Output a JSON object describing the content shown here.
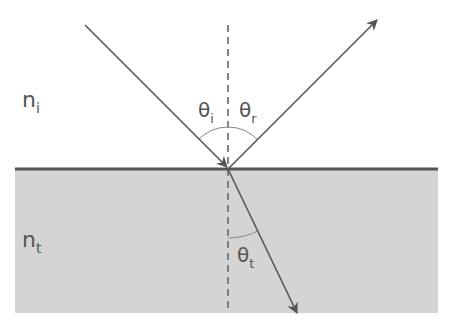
{
  "diagram": {
    "colors": {
      "background": "#ffffff",
      "medium_t": "#d4d4d4",
      "interface_line": "#555555",
      "ray": "#555555",
      "normal": "#666666",
      "arc": "#777777",
      "label": "#555555"
    },
    "regions": [
      {
        "id": "medium-i",
        "label": "n",
        "subscript": "i"
      },
      {
        "id": "medium-t",
        "label": "n",
        "subscript": "t"
      }
    ],
    "angles": [
      {
        "id": "theta-i",
        "symbol": "θ",
        "subscript": "i"
      },
      {
        "id": "theta-r",
        "symbol": "θ",
        "subscript": "r"
      },
      {
        "id": "theta-t",
        "symbol": "θ",
        "subscript": "t"
      }
    ],
    "rays": [
      {
        "id": "incident",
        "from": [
          85,
          25
        ],
        "to": [
          228,
          168
        ]
      },
      {
        "id": "reflected",
        "from": [
          228,
          168
        ],
        "to": [
          377,
          20
        ]
      },
      {
        "id": "refracted",
        "from": [
          228,
          168
        ],
        "to": [
          297,
          313
        ]
      }
    ],
    "normal": {
      "x": 228,
      "y_start": 25,
      "y_end": 313
    }
  }
}
